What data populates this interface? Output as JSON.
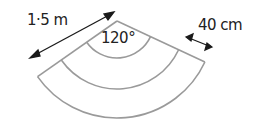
{
  "diagram": {
    "type": "sector-path",
    "labels": {
      "outer_length": "1·5 m",
      "angle": "120°",
      "path_width": "40 cm"
    },
    "geometry": {
      "apex": [
        117,
        21
      ],
      "sector_angle_deg": 120,
      "radii_px": [
        37,
        68,
        97
      ],
      "rotation_deg": -5
    },
    "colors": {
      "outline": "#9a9a9a",
      "arrow": "#1a1a1a",
      "text": "#222222"
    }
  }
}
